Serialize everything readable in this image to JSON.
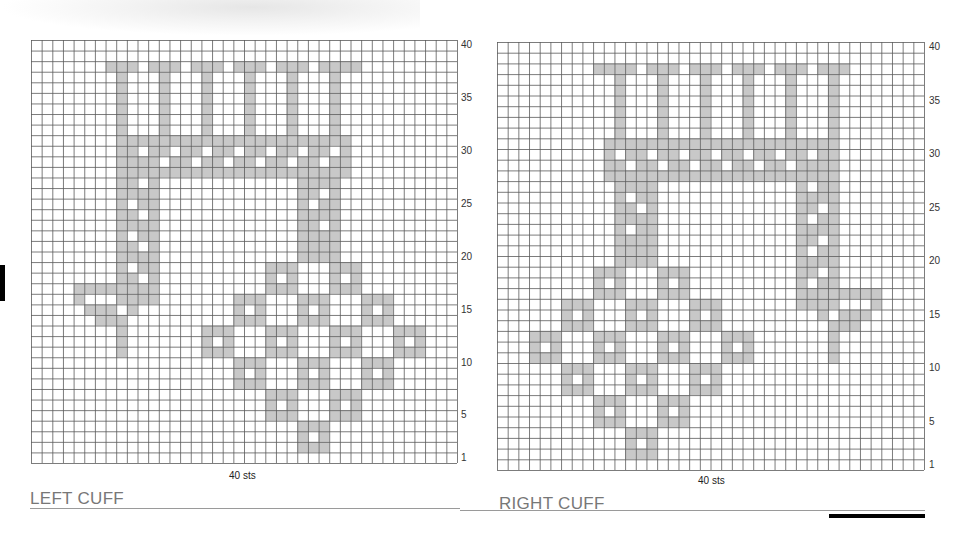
{
  "colors": {
    "shade": "#c8c8c8",
    "grid_line": "#5a5a5a",
    "title": "#777777"
  },
  "grid": {
    "cols": 40,
    "rows": 40
  },
  "row_labels": [
    "40",
    "35",
    "30",
    "25",
    "20",
    "15",
    "10",
    "5",
    "1"
  ],
  "row_label_rows": [
    40,
    35,
    30,
    25,
    20,
    15,
    10,
    5,
    1
  ],
  "charts": [
    {
      "id": "left",
      "title": "LEFT CUFF",
      "width_label": "40 sts",
      "mirror": false
    },
    {
      "id": "right",
      "title": "RIGHT CUFF",
      "width_label": "40 sts",
      "mirror": true
    }
  ],
  "pattern": {
    "note_coords": "col 0 = leftmost, row 0 = top (row 40)",
    "top_bar": {
      "row": 2,
      "col_start": 7,
      "col_end": 30,
      "gaps": [
        10,
        14,
        18,
        22,
        26
      ]
    },
    "posts": {
      "cols": [
        8,
        12,
        16,
        20,
        24,
        28
      ],
      "row_start": 3,
      "row_end": 8
    },
    "band": {
      "row_start": 9,
      "row_end": 12,
      "col_start": 8,
      "col_end": 29
    },
    "left_strand": {
      "col_start": 8,
      "col_end": 11,
      "row_start": 12,
      "row_end": 24
    },
    "right_strand": {
      "col_start": 25,
      "col_end": 28,
      "row_start": 12,
      "row_end": 20
    },
    "hook": [
      [
        23,
        4
      ],
      [
        23,
        5
      ],
      [
        23,
        6
      ],
      [
        23,
        7
      ],
      [
        23,
        8
      ],
      [
        23,
        9
      ],
      [
        23,
        10
      ],
      [
        24,
        4
      ],
      [
        24,
        9
      ],
      [
        24,
        10
      ],
      [
        25,
        5
      ],
      [
        25,
        6
      ],
      [
        25,
        7
      ],
      [
        25,
        9
      ],
      [
        26,
        6
      ],
      [
        26,
        7
      ],
      [
        26,
        8
      ],
      [
        27,
        8
      ],
      [
        28,
        8
      ],
      [
        29,
        8
      ]
    ],
    "rings": [
      [
        26,
        19
      ],
      [
        23,
        22
      ],
      [
        29,
        22
      ],
      [
        20,
        25
      ],
      [
        26,
        25
      ],
      [
        32,
        25
      ],
      [
        17,
        28
      ],
      [
        23,
        28
      ],
      [
        29,
        28
      ],
      [
        35,
        28
      ],
      [
        20,
        31
      ],
      [
        26,
        31
      ],
      [
        32,
        31
      ],
      [
        23,
        34
      ],
      [
        29,
        34
      ],
      [
        26,
        37
      ]
    ]
  }
}
